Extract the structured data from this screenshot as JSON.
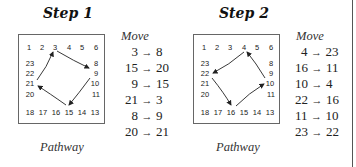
{
  "steps": [
    {
      "title": "Step 1",
      "caption": "Pathway",
      "moves_header": "Move",
      "arrow": "→",
      "moves": [
        {
          "from": "3",
          "to": "8"
        },
        {
          "from": "15",
          "to": "20"
        },
        {
          "from": "9",
          "to": "15"
        },
        {
          "from": "21",
          "to": "3"
        },
        {
          "from": "8",
          "to": "9"
        },
        {
          "from": "20",
          "to": "21"
        }
      ],
      "grid": {
        "top": [
          "1",
          "2",
          "3",
          "4",
          "5",
          "6"
        ],
        "left": [
          "23",
          "22",
          "21",
          "20"
        ],
        "right": [
          "8",
          "9",
          "10",
          "11"
        ],
        "bottom": [
          "18",
          "17",
          "16",
          "15",
          "14",
          "13"
        ]
      },
      "pathway_arrows": [
        {
          "from": "3",
          "to": "9"
        },
        {
          "from": "9",
          "to": "15"
        },
        {
          "from": "15",
          "to": "21"
        },
        {
          "from": "21",
          "to": "3"
        }
      ]
    },
    {
      "title": "Step 2",
      "caption": "Pathway",
      "moves_header": "Move",
      "arrow": "→",
      "moves": [
        {
          "from": "4",
          "to": "23"
        },
        {
          "from": "16",
          "to": "11"
        },
        {
          "from": "10",
          "to": "4"
        },
        {
          "from": "22",
          "to": "16"
        },
        {
          "from": "11",
          "to": "10"
        },
        {
          "from": "23",
          "to": "22"
        }
      ],
      "grid": {
        "top": [
          "1",
          "2",
          "3",
          "4",
          "5",
          "6"
        ],
        "left": [
          "23",
          "22",
          "21",
          "20"
        ],
        "right": [
          "8",
          "9",
          "10",
          "11"
        ],
        "bottom": [
          "18",
          "17",
          "16",
          "15",
          "14",
          "13"
        ]
      },
      "pathway_arrows": [
        {
          "from": "4",
          "to": "22"
        },
        {
          "from": "22",
          "to": "16"
        },
        {
          "from": "16",
          "to": "10"
        },
        {
          "from": "10",
          "to": "4"
        }
      ]
    }
  ]
}
